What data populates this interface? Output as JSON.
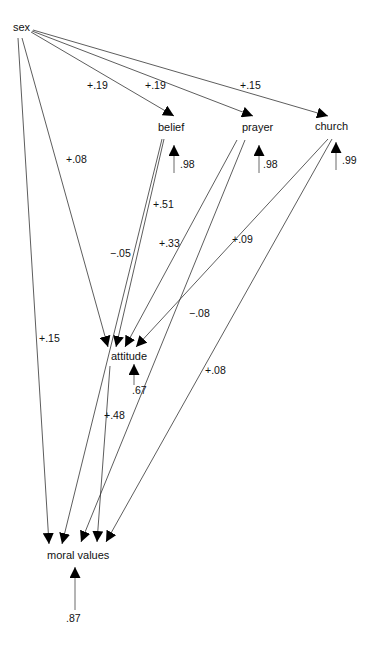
{
  "diagram": {
    "type": "path diagram",
    "nodes": {
      "sex": "sex",
      "belief": "belief",
      "prayer": "prayer",
      "church": "church",
      "attitude": "attitude",
      "moral_values": "moral values"
    },
    "paths": [
      {
        "from": "sex",
        "to": "belief",
        "label": "+.19"
      },
      {
        "from": "sex",
        "to": "prayer",
        "label": "+.19"
      },
      {
        "from": "sex",
        "to": "church",
        "label": "+.15"
      },
      {
        "from": "sex",
        "to": "attitude",
        "label": "+.08"
      },
      {
        "from": "sex",
        "to": "moral values",
        "label": "+.15"
      },
      {
        "from": "belief",
        "to": "attitude",
        "label": "+.51"
      },
      {
        "from": "belief",
        "to": "moral values",
        "label": "−.05"
      },
      {
        "from": "prayer",
        "to": "attitude",
        "label": "+.33"
      },
      {
        "from": "prayer",
        "to": "moral values",
        "label": "−.08"
      },
      {
        "from": "church",
        "to": "attitude",
        "label": "+.09"
      },
      {
        "from": "church",
        "to": "moral values",
        "label": "+.08"
      },
      {
        "from": "attitude",
        "to": "moral values",
        "label": "+.48"
      }
    ],
    "errors": {
      "belief": ".98",
      "prayer": ".98",
      "church": ".99",
      "attitude": ".67",
      "moral_values": ".87"
    }
  }
}
